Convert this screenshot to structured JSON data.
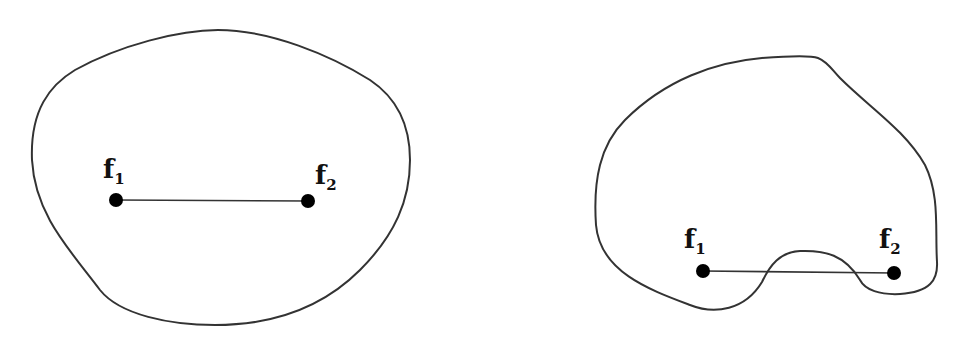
{
  "diagram": {
    "panels": [
      {
        "name": "convex-region",
        "foci": [
          {
            "label": "f",
            "subscript": "1",
            "x": 116,
            "y": 200
          },
          {
            "label": "f",
            "subscript": "2",
            "x": 308,
            "y": 201
          }
        ]
      },
      {
        "name": "nonconvex-region",
        "foci": [
          {
            "label": "f",
            "subscript": "1",
            "x": 703,
            "y": 271
          },
          {
            "label": "f",
            "subscript": "2",
            "x": 894,
            "y": 273
          }
        ]
      }
    ],
    "colors": {
      "stroke": "#333333",
      "dot": "#000000",
      "background": "#ffffff"
    }
  }
}
